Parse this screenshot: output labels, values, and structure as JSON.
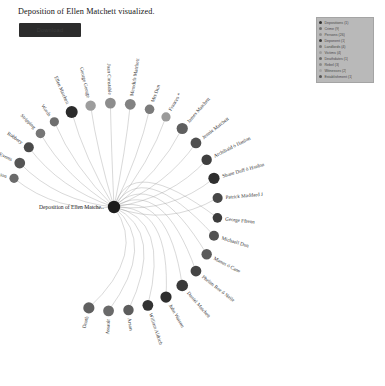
{
  "page": {
    "title": "Deposition of Ellen Matchett visualized."
  },
  "toolbar": {
    "action_label": "Download"
  },
  "legend": {
    "items": [
      {
        "label": "Depositions (1)",
        "color": "#2f2f2f"
      },
      {
        "label": "Crime (9)",
        "color": "#6f6f6f"
      },
      {
        "label": "Persons (26)",
        "color": "#8e8e8e"
      },
      {
        "label": "Deponent (1)",
        "color": "#3a3a3a"
      },
      {
        "label": "Landlords (4)",
        "color": "#787878"
      },
      {
        "label": "Victims (4)",
        "color": "#9b9b9b"
      },
      {
        "label": "Deathdates (1)",
        "color": "#6a6a6a"
      },
      {
        "label": "Rebel (3)",
        "color": "#8a8a8a"
      },
      {
        "label": "Witnesses (2)",
        "color": "#a2a2a2"
      },
      {
        "label": "Establishment (1)",
        "color": "#555555"
      }
    ]
  },
  "chart_data": {
    "type": "network",
    "layout": "radial-hub",
    "hub": {
      "label": "Deposition of Ellen Matche..",
      "color": "#1d1d1d",
      "radius": 6.2,
      "x": 114,
      "y": 207
    },
    "nodes": [
      {
        "label": "Possession",
        "color": "#6b6b6b",
        "radius": 4.6,
        "angle": 196
      },
      {
        "label": "Multiple Events",
        "color": "#555555",
        "radius": 5.4,
        "angle": 205
      },
      {
        "label": "Robbery",
        "color": "#4a4a4a",
        "radius": 5.0,
        "angle": 215
      },
      {
        "label": "Stripping",
        "color": "#767676",
        "radius": 4.8,
        "angle": 225
      },
      {
        "label": "Words",
        "color": "#6e6e6e",
        "radius": 4.6,
        "angle": 235
      },
      {
        "label": "Ellen Matchett",
        "color": "#2b2b2b",
        "radius": 6.0,
        "angle": 246
      },
      {
        "label": "George George",
        "color": "#9d9d9d",
        "radius": 5.2,
        "angle": 257
      },
      {
        "label": "Joan Constable",
        "color": "#8d8d8d",
        "radius": 5.4,
        "angle": 268
      },
      {
        "label": "Meredith Matchett",
        "color": "#828282",
        "radius": 5.4,
        "angle": 279
      },
      {
        "label": "Mrs Dun",
        "color": "#7b7b7b",
        "radius": 4.8,
        "angle": 290
      },
      {
        "label": "Frances *",
        "color": "#9a9a9a",
        "radius": 4.6,
        "angle": 300
      },
      {
        "label": "James Matchett",
        "color": "#5f5f5f",
        "radius": 5.6,
        "angle": 311
      },
      {
        "label": "Jennie Matchett",
        "color": "#4f4f4f",
        "radius": 5.4,
        "angle": 322
      },
      {
        "label": "Archibald ó Hanlon",
        "color": "#3f3f3f",
        "radius": 5.2,
        "angle": 333
      },
      {
        "label": "Shane Duff ó Hanlon",
        "color": "#2f2f2f",
        "radius": 5.6,
        "angle": 344
      },
      {
        "label": "Patrick Maddard J",
        "color": "#474747",
        "radius": 5.0,
        "angle": 355
      },
      {
        "label": "George Ffrenn",
        "color": "#3c3c3c",
        "radius": 4.8,
        "angle": 6
      },
      {
        "label": "Michaell Dun",
        "color": "#525252",
        "radius": 5.0,
        "angle": 16
      },
      {
        "label": "Manus ó Cane",
        "color": "#5a5a5a",
        "radius": 5.2,
        "angle": 27
      },
      {
        "label": "Phelim Roe ó Neile",
        "color": "#454545",
        "radius": 5.4,
        "angle": 38
      },
      {
        "label": "Daniel Matchett",
        "color": "#3a3a3a",
        "radius": 5.8,
        "angle": 49
      },
      {
        "label": "John Watson",
        "color": "#2e2e2e",
        "radius": 5.6,
        "angle": 60
      },
      {
        "label": "William Aldrich",
        "color": "#333333",
        "radius": 5.4,
        "angle": 71
      },
      {
        "label": "Arson",
        "color": "#5d5d5d",
        "radius": 5.2,
        "angle": 82
      },
      {
        "label": "Assault",
        "color": "#6a6a6a",
        "radius": 5.4,
        "angle": 93
      },
      {
        "label": "Death",
        "color": "#606060",
        "radius": 5.6,
        "angle": 104
      }
    ]
  }
}
